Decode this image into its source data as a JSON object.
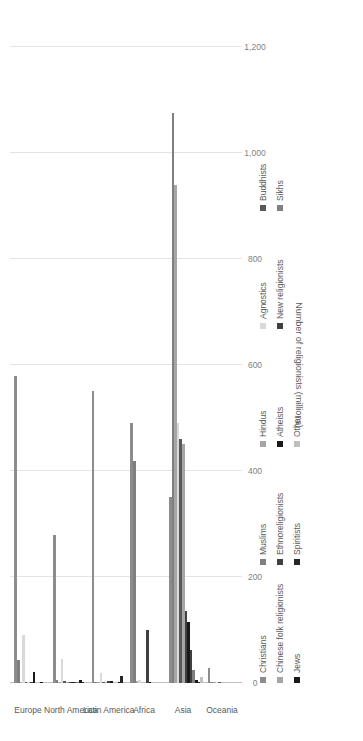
{
  "chart_data": {
    "type": "bar",
    "orientation": "horizontal-rotated",
    "title": "",
    "xlabel": "",
    "ylabel": "Number of religionists (millions)",
    "axis_title": "Number of religionists (millions)",
    "tick_labels": [
      "0",
      "200",
      "400",
      "600",
      "800",
      "1,000",
      "1,200"
    ],
    "ticks": [
      0,
      200,
      400,
      600,
      800,
      1000,
      1200
    ],
    "ylim": [
      0,
      1200
    ],
    "grid": true,
    "legend_position": "bottom",
    "categories": [
      "Europe",
      "North America",
      "Latin America",
      "Africa",
      "Asia",
      "Oceania"
    ],
    "series": [
      {
        "name": "Christians",
        "color": "#8c8c8c",
        "values": [
          580,
          280,
          550,
          490,
          350,
          28
        ]
      },
      {
        "name": "Muslims",
        "color": "#7f7f7f",
        "values": [
          44,
          5,
          1,
          418,
          1075,
          1
        ]
      },
      {
        "name": "Hindus",
        "color": "#a6a6a6",
        "values": [
          2,
          2,
          1,
          3,
          940,
          1
        ]
      },
      {
        "name": "Agnostics",
        "color": "#d9d9d9",
        "values": [
          90,
          45,
          19,
          6,
          490,
          1
        ]
      },
      {
        "name": "Buddhists",
        "color": "#595959",
        "values": [
          2,
          4,
          1,
          0,
          460,
          1
        ]
      },
      {
        "name": "Chinese folk religionists",
        "color": "#a6a6a6",
        "values": [
          0,
          1,
          0,
          0,
          450,
          0
        ]
      },
      {
        "name": "Ethnoreligionists",
        "color": "#404040",
        "values": [
          1,
          1,
          3,
          100,
          135,
          0
        ]
      },
      {
        "name": "Atheists",
        "color": "#1a1a1a",
        "values": [
          20,
          2,
          3,
          1,
          115,
          0
        ]
      },
      {
        "name": "New religionists",
        "color": "#404040",
        "values": [
          0,
          1,
          0,
          0,
          62,
          0
        ]
      },
      {
        "name": "Sikhs",
        "color": "#808080",
        "values": [
          0,
          1,
          0,
          0,
          25,
          0
        ]
      },
      {
        "name": "Jews",
        "color": "#1a1a1a",
        "values": [
          2,
          6,
          1,
          0,
          6,
          0
        ]
      },
      {
        "name": "Spiritists",
        "color": "#262626",
        "values": [
          0,
          1,
          13,
          0,
          1,
          0
        ]
      },
      {
        "name": "Other",
        "color": "#bfbfbf",
        "values": [
          1,
          1,
          1,
          1,
          12,
          0
        ]
      }
    ],
    "legend_columns": [
      [
        "Christians",
        "Chinese folk religionists",
        "Jews"
      ],
      [
        "Muslims",
        "Ethnoreligionists",
        "Spiritists"
      ],
      [
        "Hindus",
        "Atheists",
        "Other"
      ],
      [
        "Agnostics",
        "New religionists"
      ],
      [
        "Buddhists",
        "Sikhs"
      ]
    ],
    "legend_colors": [
      [
        "#8c8c8c",
        "#a6a6a6",
        "#1a1a1a"
      ],
      [
        "#7f7f7f",
        "#404040",
        "#262626"
      ],
      [
        "#a6a6a6",
        "#1a1a1a",
        "#bfbfbf"
      ],
      [
        "#d9d9d9",
        "#404040"
      ],
      [
        "#595959",
        "#808080"
      ]
    ]
  }
}
